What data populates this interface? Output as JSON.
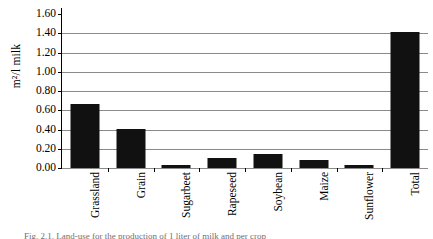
{
  "chart_data": {
    "type": "bar",
    "title": "",
    "xlabel": "",
    "ylabel": "m²/l milk",
    "categories": [
      "Grassland",
      "Grain",
      "Sugarbeet",
      "Rapeseed",
      "Soybean",
      "Maize",
      "Sunflower",
      "Total"
    ],
    "values": [
      0.67,
      0.41,
      0.03,
      0.1,
      0.15,
      0.08,
      0.03,
      1.41
    ],
    "ylim": [
      0.0,
      1.6
    ],
    "ytick_labels": [
      "1.60",
      "1.40",
      "1.20",
      "1.00",
      "0.80",
      "0.60",
      "0.40",
      "0.20",
      "0.00"
    ],
    "ytick_values": [
      1.6,
      1.4,
      1.2,
      1.0,
      0.8,
      0.6,
      0.4,
      0.2,
      0.0
    ],
    "grid": "horizontal",
    "legend": "none",
    "bar_color": "#111111",
    "gridline_color": "#8a8a8a",
    "axis_color": "#000000"
  },
  "caption": {
    "text": "Fig. 2.1. Land-use for the production of 1 liter of milk and per crop"
  }
}
